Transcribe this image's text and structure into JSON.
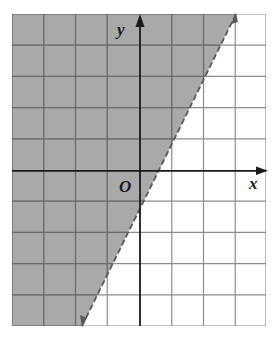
{
  "figure": {
    "type": "linear-inequality-graph",
    "axes": {
      "x_label": "x",
      "y_label": "y",
      "origin_label": "O",
      "x_range": [
        -4,
        4
      ],
      "y_range": [
        -5,
        5
      ],
      "grid_step": 1
    },
    "boundary_line": {
      "equation": "y = 2x - 1",
      "style": "dashed",
      "points": [
        [
          3,
          5
        ],
        [
          -2,
          -5
        ]
      ]
    },
    "shaded_region": {
      "description": "region left of / above the boundary line",
      "inequality": "y > 2x - 1"
    },
    "colors": {
      "shade": "#a9a9a9",
      "grid_on_shade": "#6e6e6e",
      "grid_on_white": "#9c9c9c",
      "axis": "#1a1a1a",
      "boundary": "#5a5a5a"
    }
  }
}
